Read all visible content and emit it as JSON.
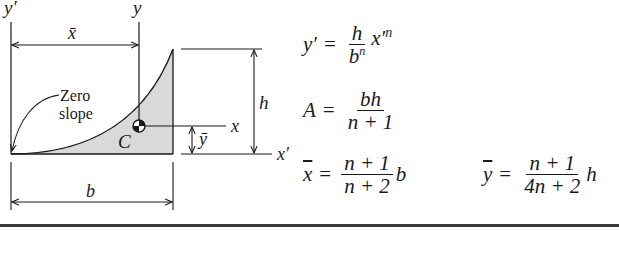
{
  "figure": {
    "labels": {
      "y_prime_axis": "y′",
      "y_axis": "y",
      "x_axis": "x",
      "x_prime_axis": "x′",
      "x_bar_dim": "x̄",
      "y_bar_dim": "ȳ",
      "h_dim": "h",
      "b_dim": "b",
      "centroid": "C",
      "annotation_line1": "Zero",
      "annotation_line2": "slope"
    },
    "fill_color": "#d9d9d9",
    "line_color": "#1a1a1a"
  },
  "equations": {
    "curve": {
      "lhs": "y′",
      "eq": "=",
      "num": "h",
      "den_base": "b",
      "den_exp": "n",
      "tail_base": "x′",
      "tail_exp": "n"
    },
    "area": {
      "lhs": "A",
      "eq": "=",
      "num": "bh",
      "den": "n + 1"
    },
    "x_bar": {
      "lhs": "x",
      "eq": "=",
      "num": "n + 1",
      "den": "n + 2",
      "tail": "b"
    },
    "y_bar": {
      "lhs": "y",
      "eq": "=",
      "num": "n + 1",
      "den": "4n + 2",
      "tail": "h"
    }
  }
}
